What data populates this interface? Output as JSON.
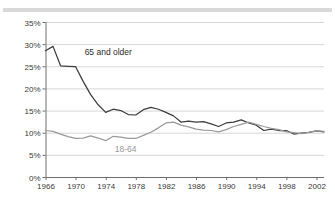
{
  "chart_data": {
    "type": "line",
    "title": "",
    "subtitle": "",
    "xlabel": "",
    "ylabel": "",
    "xlim": [
      1966,
      2003
    ],
    "ylim": [
      0,
      35
    ],
    "grid": true,
    "legend_position": "inline-annotation",
    "y_ticks": [
      "0%",
      "5%",
      "10%",
      "15%",
      "20%",
      "25%",
      "30%",
      "35%"
    ],
    "y_tick_values": [
      0,
      5,
      10,
      15,
      20,
      25,
      30,
      35
    ],
    "x_ticks": [
      "1966",
      "1970",
      "1974",
      "1978",
      "1982",
      "1986",
      "1990",
      "1994",
      "1998",
      "2002"
    ],
    "x_tick_values": [
      1966,
      1970,
      1974,
      1978,
      1982,
      1986,
      1990,
      1994,
      1998,
      2002
    ],
    "x": [
      1966,
      1967,
      1968,
      1969,
      1970,
      1971,
      1972,
      1973,
      1974,
      1975,
      1976,
      1977,
      1978,
      1979,
      1980,
      1981,
      1982,
      1983,
      1984,
      1985,
      1986,
      1987,
      1988,
      1989,
      1990,
      1991,
      1992,
      1993,
      1994,
      1995,
      1996,
      1997,
      1998,
      1999,
      2000,
      2001,
      2002,
      2003
    ],
    "series": [
      {
        "name": "65 and older",
        "color": "#3d3d3d",
        "label_x": 1971.2,
        "label_y": 27.6,
        "values": [
          28.5,
          29.5,
          25.1,
          25.0,
          24.9,
          21.6,
          18.6,
          16.3,
          14.6,
          15.3,
          15.0,
          14.1,
          14.0,
          15.2,
          15.7,
          15.3,
          14.6,
          13.8,
          12.4,
          12.6,
          12.4,
          12.5,
          12.0,
          11.4,
          12.2,
          12.4,
          12.9,
          12.2,
          11.7,
          10.5,
          10.8,
          10.5,
          10.5,
          9.7,
          9.9,
          10.1,
          10.4,
          10.2
        ]
      },
      {
        "name": "18-64",
        "color": "#9a9a9a",
        "label_x": 1975.2,
        "label_y": 5.6,
        "values": [
          10.5,
          10.3,
          9.7,
          9.1,
          8.7,
          8.8,
          9.3,
          8.8,
          8.2,
          9.2,
          9.0,
          8.7,
          8.7,
          9.4,
          10.1,
          11.1,
          12.2,
          12.4,
          11.7,
          11.3,
          10.8,
          10.6,
          10.5,
          10.2,
          10.7,
          11.4,
          11.9,
          12.4,
          11.9,
          11.4,
          11.0,
          10.7,
          10.2,
          10.0,
          9.8,
          10.1,
          10.4,
          10.3
        ]
      }
    ]
  },
  "axis": {
    "axis_color": "#6e6e6e",
    "grid_color": "#d6d6d6",
    "background": "#ffffff"
  }
}
